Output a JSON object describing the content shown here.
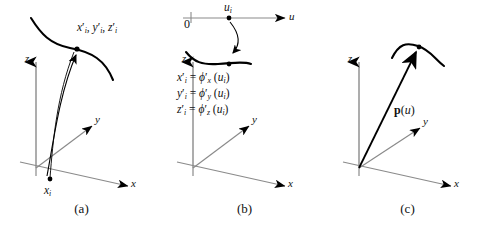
{
  "panels": [
    {
      "id": "a",
      "caption": "(a)",
      "axes": [
        {
          "name": "z-axis",
          "label": "z"
        },
        {
          "name": "y-axis",
          "label": "y"
        },
        {
          "name": "x-axis",
          "label": "x"
        }
      ],
      "point_label": "x′ᵢ, y′ᵢ, z′ᵢ",
      "point_parts": {
        "x": "x",
        "x_prime": "′",
        "x_sub": "i",
        "y": "y",
        "y_prime": "′",
        "y_sub": "i",
        "z": "z",
        "z_prime": "′",
        "z_sub": "i"
      },
      "base_point_label": "x",
      "base_point_sub": "i"
    },
    {
      "id": "b",
      "caption": "(b)",
      "axes": [
        {
          "name": "z-axis",
          "label": "z"
        },
        {
          "name": "y-axis",
          "label": "y"
        },
        {
          "name": "x-axis",
          "label": "x"
        },
        {
          "name": "u-axis",
          "label": "u"
        }
      ],
      "origin_label": "0",
      "parameter_label": "u",
      "parameter_sub": "i",
      "equations": [
        {
          "lhs": "x",
          "lhs_prime": "′",
          "lhs_sub": "i",
          "op": "=",
          "fn": "ϕ",
          "fn_prime": "′",
          "fn_sub": "x",
          "arg_open": "(",
          "arg": "u",
          "arg_sub": "i",
          "arg_close": ")"
        },
        {
          "lhs": "y",
          "lhs_prime": "′",
          "lhs_sub": "i",
          "op": "=",
          "fn": "ϕ",
          "fn_prime": "′",
          "fn_sub": "y",
          "arg_open": "(",
          "arg": "u",
          "arg_sub": "i",
          "arg_close": ")"
        },
        {
          "lhs": "z",
          "lhs_prime": "′",
          "lhs_sub": "i",
          "op": "=",
          "fn": "ϕ",
          "fn_prime": "′",
          "fn_sub": "z",
          "arg_open": "(",
          "arg": "u",
          "arg_sub": "i",
          "arg_close": ")"
        }
      ]
    },
    {
      "id": "c",
      "caption": "(c)",
      "axes": [
        {
          "name": "z-axis",
          "label": "z"
        },
        {
          "name": "y-axis",
          "label": "y"
        },
        {
          "name": "x-axis",
          "label": "x"
        }
      ],
      "vector_label": {
        "name": "p",
        "open": "(",
        "arg": "u",
        "close": ")"
      }
    }
  ],
  "colors": {
    "axis": "#8a8a8a",
    "curve": "#000000",
    "arrow": "#000000",
    "text": "#111111",
    "background": "#ffffff"
  }
}
